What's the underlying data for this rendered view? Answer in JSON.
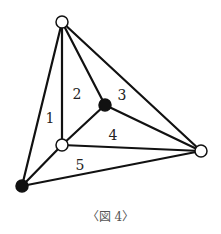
{
  "figure": {
    "caption": "〈図 4〉",
    "colors": {
      "edge": "#111111",
      "vertex_filled": "#111111",
      "vertex_open_fill": "#ffffff",
      "vertex_open_stroke": "#111111",
      "background": "#ffffff"
    },
    "vertices": [
      {
        "id": "top",
        "x": 62,
        "y": 22,
        "type": "open"
      },
      {
        "id": "center",
        "x": 105,
        "y": 105,
        "type": "filled"
      },
      {
        "id": "inner-left",
        "x": 62,
        "y": 145,
        "type": "open"
      },
      {
        "id": "bottom-left",
        "x": 22,
        "y": 186,
        "type": "filled"
      },
      {
        "id": "right",
        "x": 201,
        "y": 151,
        "type": "open"
      }
    ],
    "edges": [
      [
        "top",
        "bottom-left"
      ],
      [
        "top",
        "inner-left"
      ],
      [
        "top",
        "center"
      ],
      [
        "top",
        "right"
      ],
      [
        "center",
        "inner-left"
      ],
      [
        "center",
        "right"
      ],
      [
        "inner-left",
        "right"
      ],
      [
        "inner-left",
        "bottom-left"
      ],
      [
        "bottom-left",
        "right"
      ]
    ],
    "region_labels": [
      {
        "text": "1",
        "x": 50,
        "y": 118
      },
      {
        "text": "2",
        "x": 77,
        "y": 94
      },
      {
        "text": "3",
        "x": 122,
        "y": 95
      },
      {
        "text": "4",
        "x": 113,
        "y": 135
      },
      {
        "text": "5",
        "x": 80,
        "y": 165
      }
    ]
  }
}
